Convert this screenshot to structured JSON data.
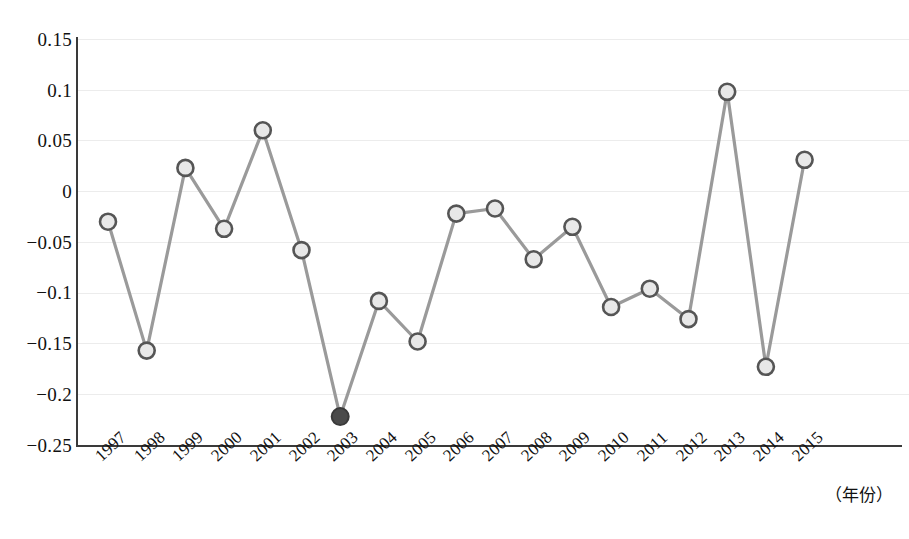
{
  "chart_data": {
    "type": "line",
    "title": "",
    "subtitle": "",
    "xlabel": "（年份）",
    "ylabel": "",
    "categories": [
      "1997",
      "1998",
      "1999",
      "2000",
      "2001",
      "2002",
      "2003",
      "2004",
      "2005",
      "2006",
      "2007",
      "2008",
      "2009",
      "2010",
      "2011",
      "2012",
      "2013",
      "2014",
      "2015"
    ],
    "values": [
      -0.03,
      -0.157,
      0.023,
      -0.037,
      0.06,
      -0.058,
      -0.222,
      -0.108,
      -0.148,
      -0.022,
      -0.017,
      -0.067,
      -0.035,
      -0.114,
      -0.096,
      -0.126,
      0.098,
      -0.173,
      0.031
    ],
    "series": [
      {
        "name": "series-1",
        "values": [
          -0.03,
          -0.157,
          0.023,
          -0.037,
          0.06,
          -0.058,
          -0.222,
          -0.108,
          -0.148,
          -0.022,
          -0.017,
          -0.067,
          -0.035,
          -0.114,
          -0.096,
          -0.126,
          0.098,
          -0.173,
          0.031
        ]
      }
    ],
    "highlighted_points": [
      {
        "category": "2003",
        "value": -0.222,
        "style": "filled-dark"
      }
    ],
    "ylim": [
      -0.25,
      0.15
    ],
    "yticks": [
      0.15,
      0.1,
      0.05,
      0,
      -0.05,
      -0.1,
      -0.15,
      -0.2,
      -0.25
    ],
    "ytick_labels": [
      "0.15",
      "0.1",
      "0.05",
      "0",
      "−0.05",
      "−0.1",
      "−0.15",
      "−0.2",
      "−0.25"
    ],
    "grid": true,
    "grid_axis": "y",
    "legend": "none",
    "marker": "circle-open",
    "colors": {
      "line": "#9a9a9a",
      "marker_stroke": "#555555",
      "marker_fill": "#e8e8e8",
      "highlight_fill": "#4a4a4a",
      "highlight_stroke": "#3a3a3a",
      "grid": "#ececec",
      "axis": "#3a3a3a",
      "text": "#111111"
    }
  },
  "caption": {
    "text": ""
  }
}
